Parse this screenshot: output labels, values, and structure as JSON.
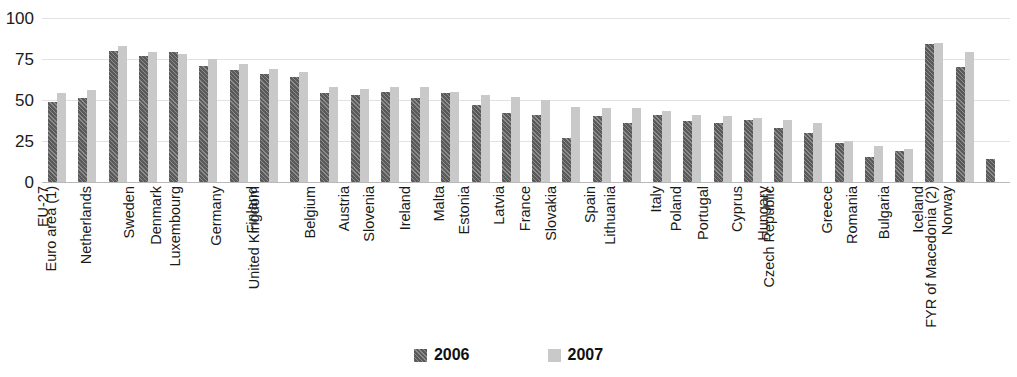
{
  "chart_data": {
    "type": "bar",
    "title": "",
    "subtitle": "",
    "xlabel": "",
    "ylabel": "",
    "ylim": [
      0,
      100
    ],
    "yticks": [
      0,
      25,
      50,
      75,
      100
    ],
    "ytick_labels": [
      "0",
      "25",
      "50",
      "75",
      "100"
    ],
    "grid": true,
    "legend_position": "bottom-center",
    "categories": [
      "EU-27",
      "Euro area (1)",
      "Netherlands",
      "Sweden",
      "Denmark",
      "Luxembourg",
      "Germany",
      "Finland",
      "United Kingdom",
      "Belgium",
      "Austria",
      "Slovenia",
      "Ireland",
      "Malta",
      "Estonia",
      "Latvia",
      "France",
      "Slovakia",
      "Spain",
      "Lithuania",
      "Italy",
      "Poland",
      "Portugal",
      "Cyprus",
      "Hungary",
      "Czech Republic",
      "Greece",
      "Romania",
      "Bulgaria",
      "Iceland",
      "Norway",
      "FYR of Macedonia (2)"
    ],
    "series": [
      {
        "name": "2006",
        "color": "#5a5a5a",
        "values": [
          49,
          51,
          80,
          77,
          79,
          71,
          68,
          66,
          64,
          54,
          53,
          55,
          51,
          54,
          47,
          42,
          41,
          27,
          40,
          36,
          41,
          37,
          36,
          38,
          33,
          30,
          24,
          15,
          19,
          84,
          70,
          14
        ]
      },
      {
        "name": "2007",
        "color": "#c9c9c9",
        "values": [
          54,
          56,
          83,
          79,
          78,
          75,
          72,
          69,
          67,
          58,
          57,
          58,
          58,
          55,
          53,
          52,
          50,
          46,
          45,
          45,
          43,
          41,
          40,
          39,
          38,
          36,
          25,
          22,
          20,
          85,
          79,
          null
        ]
      }
    ]
  },
  "legend": {
    "items": [
      {
        "label": "2006",
        "swatch": "hatched-dark-swatch"
      },
      {
        "label": "2007",
        "swatch": "solid-light-swatch"
      }
    ]
  },
  "colors": {
    "series_2006": "#5a5a5a",
    "series_2007": "#c9c9c9",
    "gridline": "#e2e2e2",
    "axis": "#b9b9b9",
    "text": "#1a1a1a",
    "background": "#ffffff"
  }
}
